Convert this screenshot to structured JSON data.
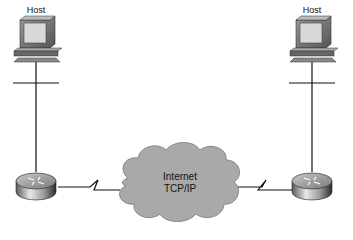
{
  "diagram": {
    "nodes": [
      {
        "id": "host-left",
        "type": "host",
        "label": "Host"
      },
      {
        "id": "host-right",
        "type": "host",
        "label": "Host"
      },
      {
        "id": "router-left",
        "type": "router",
        "label": ""
      },
      {
        "id": "router-right",
        "type": "router",
        "label": ""
      },
      {
        "id": "cloud",
        "type": "cloud",
        "label_line1": "Internet",
        "label_line2": "TCP/IP"
      }
    ],
    "edges": [
      {
        "from": "host-left",
        "to": "router-left",
        "style": "ethernet"
      },
      {
        "from": "router-left",
        "to": "cloud",
        "style": "serial"
      },
      {
        "from": "cloud",
        "to": "router-right",
        "style": "serial"
      },
      {
        "from": "router-right",
        "to": "host-right",
        "style": "ethernet"
      }
    ]
  },
  "colors": {
    "cloud_fill": "#a9a9a9",
    "line": "#111111",
    "monitor_body": "#8a8a8a",
    "screen": "#d8d8d8"
  }
}
